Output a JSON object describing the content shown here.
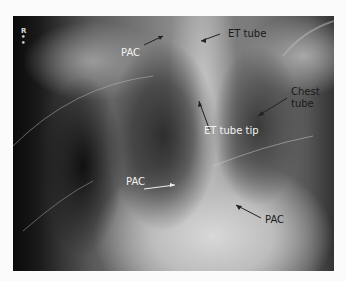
{
  "image": {
    "description": "Chest X-ray with annotated lines and tubes",
    "side_marker": "R",
    "labels": {
      "pac_top": "PAC",
      "et_tube": "ET tube",
      "chest_tube_line1": "Chest",
      "chest_tube_line2": "tube",
      "et_tube_tip": "ET tube tip",
      "pac_middle": "PAC",
      "pac_bottom": "PAC"
    }
  }
}
